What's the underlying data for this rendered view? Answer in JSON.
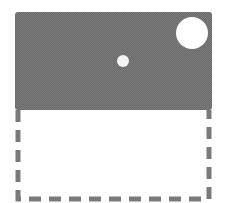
{
  "diagram": {
    "colors": {
      "background": "#ffffff",
      "filled_region": "#6e6e6e",
      "dashed_border": "#7a7a7a",
      "circles": "#ffffff"
    },
    "filled_region": {
      "x": 15,
      "y": 12,
      "width": 197,
      "height": 98
    },
    "dashed_region": {
      "x": 17,
      "y": 110,
      "width": 193,
      "height": 90
    },
    "circles": [
      {
        "name": "large-circle",
        "cx": 192,
        "cy": 33,
        "r": 16
      },
      {
        "name": "small-dot",
        "cx": 123,
        "cy": 61,
        "r": 6
      }
    ]
  }
}
